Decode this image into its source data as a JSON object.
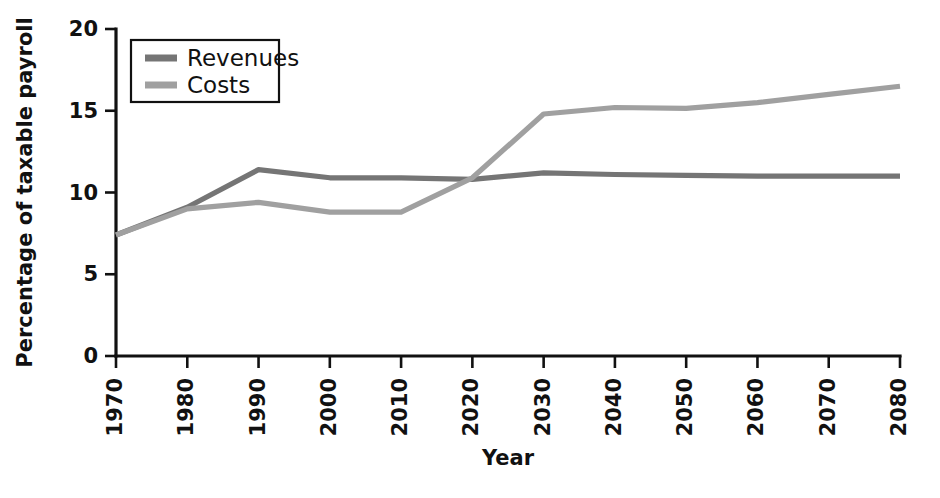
{
  "chart_data": {
    "type": "line",
    "title": "",
    "xlabel": "Year",
    "ylabel": "Percentage of taxable payroll",
    "x": [
      1970,
      1980,
      1990,
      2000,
      2010,
      2020,
      2030,
      2040,
      2050,
      2060,
      2070,
      2080
    ],
    "xticklabels": [
      "1970",
      "1980",
      "1990",
      "2000",
      "2010",
      "2020",
      "2030",
      "2040",
      "2050",
      "2060",
      "2070",
      "2080"
    ],
    "yticklabels": [
      "0",
      "5",
      "10",
      "15",
      "20"
    ],
    "yticks": [
      0,
      5,
      10,
      15,
      20
    ],
    "xlim": [
      1970,
      2080
    ],
    "ylim": [
      0,
      20
    ],
    "grid": false,
    "legend_position": "top-left",
    "series": [
      {
        "name": "Revenues",
        "color": "#757575",
        "values": [
          7.4,
          9.1,
          11.4,
          10.9,
          10.9,
          10.8,
          11.2,
          11.1,
          11.05,
          11.0,
          11.0,
          11.0
        ]
      },
      {
        "name": "Costs",
        "color": "#a0a0a0",
        "values": [
          7.4,
          9.0,
          9.4,
          8.8,
          8.8,
          10.9,
          14.8,
          15.2,
          15.15,
          15.5,
          16.0,
          16.5
        ]
      }
    ]
  },
  "legend": {
    "items": [
      {
        "label": "Revenues",
        "color": "#757575"
      },
      {
        "label": "Costs",
        "color": "#a0a0a0"
      }
    ]
  },
  "axes": {
    "x_title": "Year",
    "y_title": "Percentage of taxable payroll"
  }
}
